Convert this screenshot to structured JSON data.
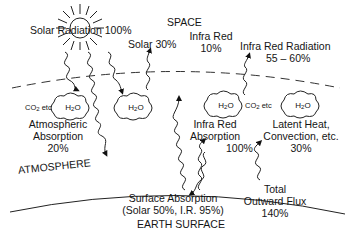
{
  "regions": {
    "space": "SPACE",
    "atmosphere": "ATMOSPHERE",
    "earth_surface": "EARTH SURFACE"
  },
  "labels": {
    "solar_radiation": "Solar Radiation  100%",
    "solar_reflected": "Solar 30%",
    "infra_red_1": "Infra Red",
    "infra_red_1_pct": "10%",
    "ir_radiation": "Infra Red Radiation",
    "ir_radiation_pct": "55 – 60%",
    "co2_left": "CO",
    "co2_right": "CO",
    "etc": " etc",
    "h2o": "H",
    "atm_abs_1": "Atmospheric",
    "atm_abs_2": "Absorption",
    "atm_abs_3": "20%",
    "ir_abs_1": "Infra Red",
    "ir_abs_2": "Absorption",
    "ir_abs_pct": "100%",
    "latent_1": "Latent Heat,",
    "latent_2": "Convection, etc.",
    "latent_3": "30%",
    "surf_1": "Surface Absorption",
    "surf_2": "(Solar 50%, I.R. 95%)",
    "total_1": "Total",
    "total_2": "Outward Flux",
    "total_3": "140%"
  },
  "flows": [
    {
      "name": "Solar Radiation",
      "value": "100%"
    },
    {
      "name": "Solar reflected",
      "value": "30%"
    },
    {
      "name": "Infra Red to space",
      "value": "10%"
    },
    {
      "name": "Infra Red Radiation",
      "value": "55-60%"
    },
    {
      "name": "Atmospheric Absorption",
      "value": "20%"
    },
    {
      "name": "Infra Red Absorption",
      "value": "100%"
    },
    {
      "name": "Latent Heat, Convection, etc.",
      "value": "30%"
    },
    {
      "name": "Surface Absorption",
      "value": "Solar 50%, I.R. 95%"
    },
    {
      "name": "Total Outward Flux",
      "value": "140%"
    }
  ]
}
